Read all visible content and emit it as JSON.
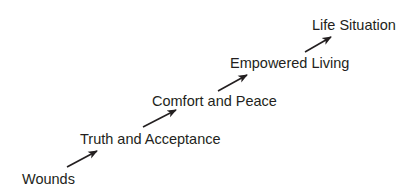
{
  "diagram": {
    "type": "ascending-staircase-flow",
    "colors": {
      "background": "#ffffff",
      "text": "#231f20",
      "arrow": "#231f20"
    },
    "steps": [
      {
        "label": "Wounds"
      },
      {
        "label": "Truth and Acceptance"
      },
      {
        "label": "Comfort and Peace"
      },
      {
        "label": "Empowered Living"
      },
      {
        "label": "Life Situation"
      }
    ],
    "arrows": [
      {
        "from": "Wounds",
        "to": "Truth and Acceptance",
        "icon": "arrow-up-right-icon"
      },
      {
        "from": "Truth and Acceptance",
        "to": "Comfort and Peace",
        "icon": "arrow-up-right-icon"
      },
      {
        "from": "Comfort and Peace",
        "to": "Empowered Living",
        "icon": "arrow-up-right-icon"
      },
      {
        "from": "Empowered Living",
        "to": "Life Situation",
        "icon": "arrow-up-right-icon"
      }
    ]
  }
}
